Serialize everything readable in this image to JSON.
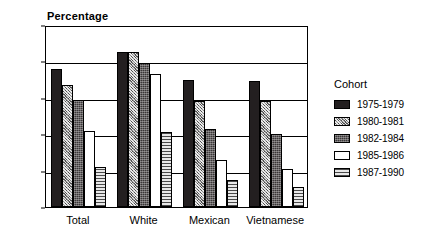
{
  "chart_data": {
    "type": "bar",
    "title": "",
    "ylabel": "Percentage",
    "xlabel": "",
    "ylim": [
      0,
      100
    ],
    "ytick_step": 20,
    "yticks": [
      0,
      20,
      40,
      60,
      80,
      100
    ],
    "ytick_labels": [
      "0",
      "20",
      "40",
      "60",
      "80",
      "100"
    ],
    "grid": true,
    "legend_position": "right",
    "legend_title": "Cohort",
    "categories": [
      "Total",
      "White",
      "Mexican",
      "Vietnamese"
    ],
    "series": [
      {
        "name": "1975-1979",
        "pattern": "solid-dark",
        "values": [
          76,
          85,
          70,
          69
        ]
      },
      {
        "name": "1980-1981",
        "pattern": "hatch-mid",
        "values": [
          67,
          85,
          58,
          58
        ]
      },
      {
        "name": "1982-1984",
        "pattern": "dense-dark",
        "values": [
          59,
          79,
          43,
          40
        ]
      },
      {
        "name": "1985-1986",
        "pattern": "white",
        "values": [
          42,
          73,
          26,
          21
        ]
      },
      {
        "name": "1987-1990",
        "pattern": "hlines",
        "values": [
          22,
          41,
          15,
          11
        ]
      }
    ]
  },
  "colors": {
    "axis": "#000000",
    "background": "#ffffff",
    "series_1975_1979": "#231f20",
    "series_1980_1981": "#8e8e8e",
    "series_1982_1984": "#3a3637",
    "series_1985_1986": "#ffffff",
    "series_1987_1990": "#d9d9d9"
  }
}
